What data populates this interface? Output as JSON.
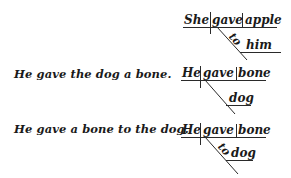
{
  "figure": {
    "examples": [
      {
        "sentence": "",
        "diagram": {
          "subject": "She",
          "verb": "gave",
          "object": "apple",
          "modifier_preposition": "to",
          "modifier_object": "him"
        }
      },
      {
        "sentence": "He gave the dog a bone.",
        "diagram": {
          "subject": "He",
          "verb": "gave",
          "object": "bone",
          "modifier_preposition": "",
          "modifier_object": "dog"
        }
      },
      {
        "sentence": "He gave a bone to the dog.",
        "diagram": {
          "subject": "He",
          "verb": "gave",
          "object": "bone",
          "modifier_preposition": "to",
          "modifier_object": "dog"
        }
      }
    ],
    "line_color": "#2a2a2a",
    "text_color": "#1a1a1a"
  }
}
